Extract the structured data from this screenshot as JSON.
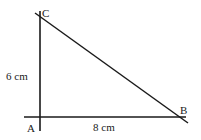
{
  "diagram": {
    "type": "right-triangle",
    "vertices": {
      "A": {
        "label": "A",
        "x": 40,
        "y": 117
      },
      "B": {
        "label": "B",
        "x": 182,
        "y": 117
      },
      "C": {
        "label": "C",
        "x": 40,
        "y": 17
      }
    },
    "sides": {
      "AC": {
        "label": "6 cm"
      },
      "AB": {
        "label": "8 cm"
      }
    },
    "line_color": "#1a1a1a"
  }
}
